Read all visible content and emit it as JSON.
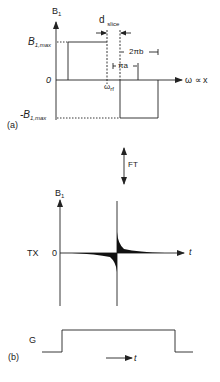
{
  "panel_a": {
    "label": "(a)",
    "y_axis_label": "B",
    "y_axis_sub": "1",
    "y_max_label": "B",
    "y_max_sub": "1,max",
    "y_min_label": "-B",
    "y_min_sub": "1,max",
    "zero_label": "0",
    "x_axis_label": "ω ∝ x",
    "d_slice_label": "d",
    "d_slice_sub": "slice",
    "two_pi_b_label": "2πb",
    "pi_a_label": "πa",
    "omega_rf_label": "ω",
    "omega_rf_sub": "rf"
  },
  "ft": {
    "label": "FT"
  },
  "tx_panel": {
    "row_label": "TX",
    "y_axis_label": "B",
    "y_axis_sub": "1",
    "zero_label": "0",
    "x_axis_label": "t"
  },
  "panel_b": {
    "label": "(b)",
    "row_label": "G",
    "time_label": "t"
  },
  "colors": {
    "line": "#222222",
    "background": "#ffffff"
  }
}
